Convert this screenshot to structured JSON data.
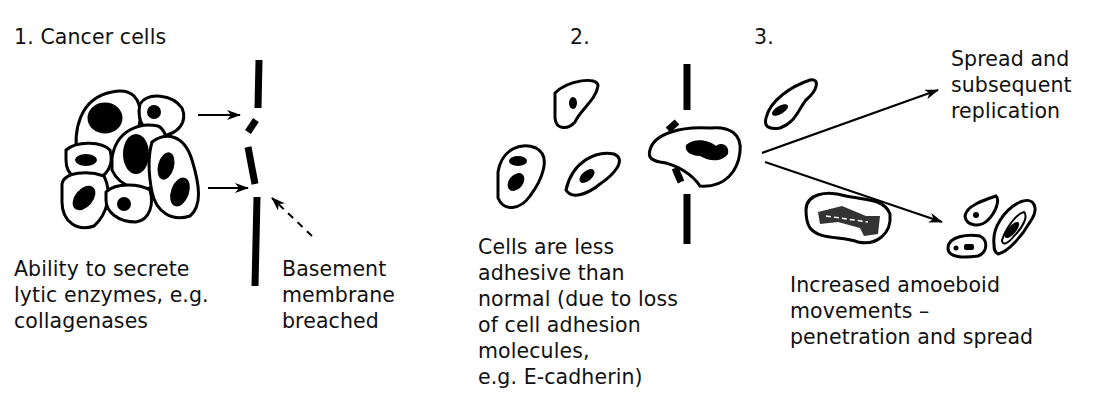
{
  "diagram": {
    "steps": [
      {
        "number_label": "1. Cancer cells",
        "caption": [
          "Ability to secrete",
          "lytic enzymes, e.g.",
          "collagenases"
        ],
        "side_caption": [
          "Basement",
          "membrane",
          "breached"
        ]
      },
      {
        "number_label": "2.",
        "caption": [
          "Cells are less",
          "adhesive than",
          "normal (due to loss",
          "of cell adhesion",
          "molecules,",
          "e.g. E-cadherin)"
        ]
      },
      {
        "number_label": "3.",
        "upper_outcome": [
          "Spread and",
          "subsequent",
          "replication"
        ],
        "caption": [
          "Increased amoeboid",
          "movements –",
          "penetration and spread"
        ]
      }
    ],
    "colors": {
      "ink": "#000000",
      "background": "#ffffff"
    }
  }
}
